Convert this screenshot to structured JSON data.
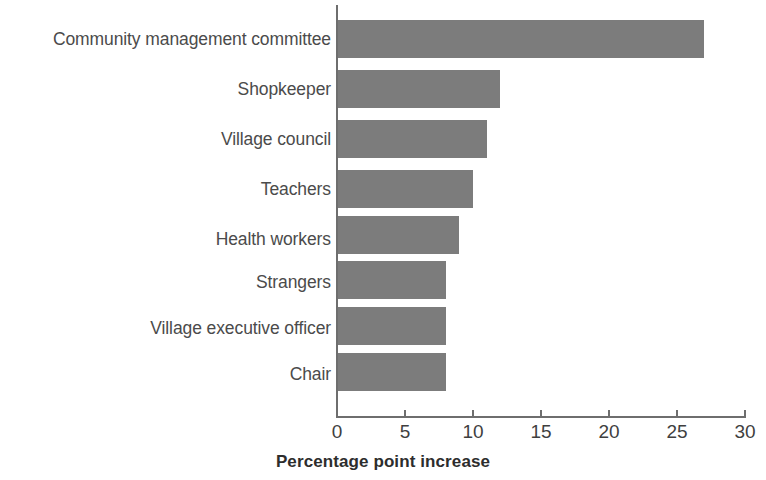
{
  "chart_data": {
    "type": "bar",
    "orientation": "horizontal",
    "title": "",
    "subtitle": "",
    "xlabel": "Percentage point increase",
    "ylabel": "",
    "categories": [
      "Community management committee",
      "Shopkeeper",
      "Village council",
      "Teachers",
      "Health workers",
      "Strangers",
      "Village executive officer",
      "Chair"
    ],
    "values": [
      27,
      12,
      11,
      10,
      9,
      8,
      8,
      8
    ],
    "xlim": [
      0,
      30
    ],
    "xticks": [
      0,
      5,
      10,
      15,
      20,
      25,
      30
    ],
    "xtick_labels": [
      "0",
      "5",
      "10",
      "15",
      "20",
      "25",
      "30"
    ],
    "grid": false,
    "legend": null,
    "bar_color": "#7c7c7c",
    "axis_color": "#6e6e6e",
    "label_color": "#4b4b4b",
    "tick_label_color": "#3f3f3f",
    "axis_title_color": "#2d2d2d"
  }
}
